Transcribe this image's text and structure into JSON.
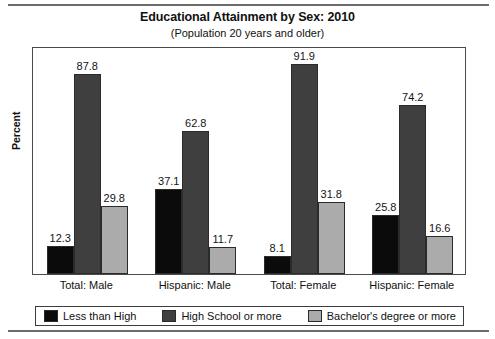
{
  "figure": {
    "title": "Educational Attainment by Sex: 2010",
    "subtitle": "(Population 20 years and older)",
    "y_axis_title": "Percent"
  },
  "chart_data": {
    "type": "bar",
    "title": "Educational Attainment by Sex: 2010",
    "subtitle": "(Population 20 years and older)",
    "xlabel": "",
    "ylabel": "Percent",
    "ylim": [
      0,
      100
    ],
    "grid": false,
    "legend_position": "bottom",
    "categories": [
      "Total: Male",
      "Hispanic: Male",
      "Total: Female",
      "Hispanic: Female"
    ],
    "series": [
      {
        "name": "Less than High",
        "color": "#0b0b0b",
        "values": [
          12.3,
          37.1,
          8.1,
          25.8
        ]
      },
      {
        "name": "High School or more",
        "color": "#3f3f3f",
        "values": [
          87.8,
          62.8,
          91.9,
          74.2
        ]
      },
      {
        "name": "Bachelor's degree or more",
        "color": "#ababab",
        "values": [
          29.8,
          11.7,
          31.8,
          16.6
        ]
      }
    ],
    "data_labels": [
      [
        "12.3",
        "87.8",
        "29.8"
      ],
      [
        "37.1",
        "62.8",
        "11.7"
      ],
      [
        "8.1",
        "91.9",
        "31.8"
      ],
      [
        "25.8",
        "74.2",
        "16.6"
      ]
    ]
  },
  "legend": {
    "items": [
      {
        "label": "Less than High",
        "color": "#0b0b0b"
      },
      {
        "label": "High School or more",
        "color": "#3f3f3f"
      },
      {
        "label": "Bachelor's degree or more",
        "color": "#ababab"
      }
    ]
  }
}
